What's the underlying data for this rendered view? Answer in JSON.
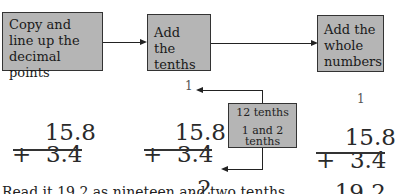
{
  "flow": {
    "steps": [
      {
        "label": "Copy and line up the decimal points"
      },
      {
        "label": "Add the tenths"
      },
      {
        "label": "Add the whole numbers"
      }
    ]
  },
  "columns": [
    {
      "top": "15.8",
      "bottom_op": "+",
      "bottom": "3.4",
      "result": "",
      "carry": ""
    },
    {
      "top": "15.8",
      "bottom_op": "+",
      "bottom": "3.4",
      "result": ".2",
      "carry": "1"
    },
    {
      "top": "15.8",
      "bottom_op": "+",
      "bottom": "3.4",
      "result": "19.2",
      "carry": "1"
    }
  ],
  "note_box": {
    "line1": "12 tenths",
    "line2": "1 and 2",
    "line3": "tenths"
  },
  "footer": {
    "text": "Read it 19.2 as nineteen and two tenths"
  }
}
